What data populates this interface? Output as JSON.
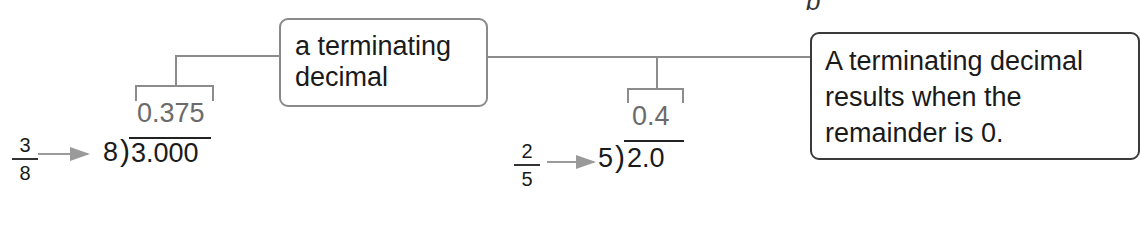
{
  "corner_label": "b",
  "concept_box": {
    "line1": "a terminating",
    "line2": "decimal"
  },
  "rule_box": {
    "line1": "A terminating decimal",
    "line2": "results when the",
    "line3": "remainder is 0."
  },
  "examples": [
    {
      "numerator": "3",
      "denominator": "8",
      "divisor": "8",
      "dividend": "3.000",
      "quotient": "0.375"
    },
    {
      "numerator": "2",
      "denominator": "5",
      "divisor": "5",
      "dividend": "2.0",
      "quotient": "0.4"
    }
  ],
  "colors": {
    "connector": "#8c8c8c",
    "quotient": "#6b6b6b",
    "text": "#1a1a1a"
  }
}
